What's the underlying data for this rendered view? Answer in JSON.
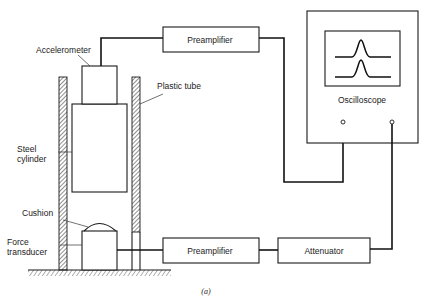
{
  "diagram": {
    "caption": "(a)",
    "blocks": {
      "preamp_top": "Preamplifier",
      "preamp_bottom": "Preamplifier",
      "attenuator": "Attenuator",
      "oscilloscope": "Oscilloscope"
    },
    "labels": {
      "accelerometer": "Accelerometer",
      "plastic_tube": "Plastic tube",
      "steel_line1": "Steel",
      "steel_line2": "cylinder",
      "cushion": "Cushion",
      "force_line1": "Force",
      "force_line2": "transducer"
    },
    "colors": {
      "line": "#1a1a1a",
      "background": "#ffffff"
    }
  }
}
